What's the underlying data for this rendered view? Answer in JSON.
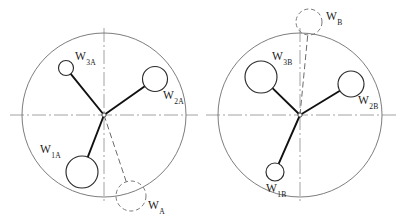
{
  "figure": {
    "background_color": "#ffffff",
    "ink_color": "#1a1a1a",
    "outline_color": "#6e6e6e",
    "arm_color": "#111111",
    "dashed_color": "#7a7a7a",
    "width": 404,
    "height": 224
  },
  "panels": [
    {
      "id": "panel-a",
      "name": "rotor-diagram-a",
      "hub": {
        "cx": 104,
        "cy": 115
      },
      "rotor": {
        "cx": 104,
        "cy": 115,
        "r": 82
      },
      "axes": {
        "horizontal": {
          "x1": 10,
          "y1": 115,
          "x2": 198,
          "y2": 115
        },
        "vertical": {
          "x1": 104,
          "y1": 28,
          "x2": 104,
          "y2": 202
        }
      },
      "weights": [
        {
          "label_base": "W",
          "label_sub": "1A",
          "cx": 82,
          "cy": 172,
          "r": 16,
          "label_x": 40,
          "label_y": 143,
          "arm_from_hub": true
        },
        {
          "label_base": "W",
          "label_sub": "2A",
          "cx": 155,
          "cy": 79,
          "r": 12.5,
          "label_x": 163,
          "label_y": 89,
          "arm_from_hub": true
        },
        {
          "label_base": "W",
          "label_sub": "3A",
          "cx": 66,
          "cy": 68,
          "r": 7.5,
          "label_x": 75,
          "label_y": 50,
          "arm_from_hub": true
        }
      ],
      "resultant": {
        "label_base": "W",
        "label_sub": "A",
        "cx": 131,
        "cy": 196,
        "r": 15,
        "label_x": 148,
        "label_y": 199
      }
    },
    {
      "id": "panel-b",
      "name": "rotor-diagram-b",
      "hub": {
        "cx": 300,
        "cy": 115
      },
      "rotor": {
        "cx": 300,
        "cy": 115,
        "r": 82
      },
      "axes": {
        "horizontal": {
          "x1": 206,
          "y1": 115,
          "x2": 396,
          "y2": 115
        },
        "vertical": {
          "x1": 300,
          "y1": 28,
          "x2": 300,
          "y2": 202
        }
      },
      "weights": [
        {
          "label_base": "W",
          "label_sub": "1B",
          "cx": 275,
          "cy": 172,
          "r": 9,
          "label_x": 266,
          "label_y": 182,
          "arm_from_hub": true
        },
        {
          "label_base": "W",
          "label_sub": "2B",
          "cx": 351,
          "cy": 84,
          "r": 13,
          "label_x": 358,
          "label_y": 94,
          "arm_from_hub": true
        },
        {
          "label_base": "W",
          "label_sub": "3B",
          "cx": 261,
          "cy": 77,
          "r": 16,
          "label_x": 272,
          "label_y": 50,
          "arm_from_hub": true
        }
      ],
      "resultant": {
        "label_base": "W",
        "label_sub": "B",
        "cx": 309,
        "cy": 22,
        "r": 13,
        "label_x": 326,
        "label_y": 10
      }
    }
  ]
}
